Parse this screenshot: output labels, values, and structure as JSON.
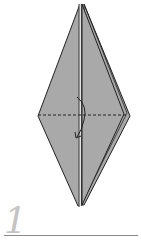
{
  "diagram": {
    "step_number": "1",
    "colors": {
      "paper_fill": "#a9a9a9",
      "outline": "#222222",
      "background": "#ffffff",
      "step_number": "#c4c4c4",
      "baseline": "#8a8a8a"
    },
    "elements": [
      {
        "type": "kite-shape",
        "description": "elongated diamond/kite base with center slit"
      },
      {
        "type": "dashed-line",
        "description": "horizontal fold line across widest point"
      },
      {
        "type": "arrow",
        "description": "curved fold arrow near center pointing down"
      }
    ]
  }
}
